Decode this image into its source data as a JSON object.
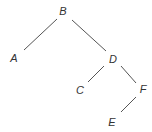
{
  "diagram": {
    "type": "binary-tree",
    "root": "B",
    "nodes": [
      {
        "id": "B",
        "label": "B"
      },
      {
        "id": "A",
        "label": "A"
      },
      {
        "id": "D",
        "label": "D"
      },
      {
        "id": "C",
        "label": "C"
      },
      {
        "id": "F",
        "label": "F"
      },
      {
        "id": "E",
        "label": "E"
      }
    ],
    "edges": [
      {
        "from": "B",
        "to": "A"
      },
      {
        "from": "B",
        "to": "D"
      },
      {
        "from": "D",
        "to": "C"
      },
      {
        "from": "D",
        "to": "F"
      },
      {
        "from": "F",
        "to": "E"
      }
    ],
    "colors": {
      "edge": "#555555",
      "label": "#333333",
      "background": "#ffffff"
    }
  }
}
